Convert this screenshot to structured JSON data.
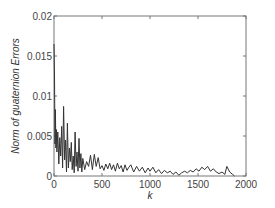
{
  "chart_data": {
    "type": "line",
    "title": "",
    "xlabel": "k",
    "ylabel": "Norm of guaternion Errors",
    "xlim": [
      0,
      2000
    ],
    "ylim": [
      0,
      0.02
    ],
    "xticks": [
      0,
      500,
      1000,
      1500,
      2000
    ],
    "xtick_labels": [
      "0",
      "500",
      "1000",
      "1500",
      "2000"
    ],
    "yticks": [
      0,
      0.005,
      0.01,
      0.015,
      0.02
    ],
    "ytick_labels": [
      "0",
      "0.005",
      "0.01",
      "0.015",
      "0.02"
    ],
    "grid": false,
    "legend": null,
    "line_color": "#333333",
    "series": [
      {
        "name": "quaternion error norm",
        "x": [
          0,
          5,
          10,
          15,
          20,
          25,
          30,
          40,
          50,
          60,
          70,
          80,
          90,
          100,
          110,
          120,
          130,
          140,
          150,
          160,
          170,
          180,
          190,
          200,
          210,
          220,
          230,
          240,
          250,
          260,
          270,
          280,
          290,
          300,
          320,
          340,
          360,
          380,
          400,
          420,
          440,
          460,
          480,
          500,
          520,
          540,
          560,
          580,
          600,
          620,
          640,
          660,
          680,
          700,
          720,
          740,
          760,
          780,
          800,
          830,
          860,
          890,
          920,
          950,
          980,
          1000,
          1030,
          1060,
          1090,
          1120,
          1150,
          1180,
          1210,
          1240,
          1270,
          1300,
          1330,
          1360,
          1390,
          1420,
          1450,
          1480,
          1510,
          1540,
          1570,
          1600,
          1630,
          1660,
          1690,
          1720,
          1750,
          1780,
          1800,
          1830,
          1860,
          1880
        ],
        "values": [
          0.0165,
          0.0125,
          0.004,
          0.0083,
          0.0035,
          0.0058,
          0.003,
          0.0055,
          0.0015,
          0.0048,
          0.0025,
          0.0062,
          0.001,
          0.0087,
          0.002,
          0.0045,
          0.0005,
          0.0066,
          0.001,
          0.0035,
          0.0018,
          0.0042,
          0.0008,
          0.0025,
          0.0004,
          0.0055,
          0.0012,
          0.003,
          0.0006,
          0.0047,
          0.001,
          0.0028,
          0.0005,
          0.0022,
          0.0008,
          0.0018,
          0.0012,
          0.0026,
          0.0008,
          0.0027,
          0.0012,
          0.0023,
          0.0009,
          0.0013,
          0.0007,
          0.0015,
          0.0009,
          0.0016,
          0.0008,
          0.0014,
          0.0006,
          0.0016,
          0.0009,
          0.0013,
          0.0005,
          0.0014,
          0.0007,
          0.0011,
          0.0014,
          0.0005,
          0.0012,
          0.0006,
          0.0011,
          0.0004,
          0.001,
          0.0006,
          0.0011,
          0.0004,
          0.0008,
          0.0003,
          0.0007,
          0.0004,
          0.0006,
          0.0002,
          0.0005,
          0.0001,
          0.0004,
          0.0006,
          0.0004,
          0.0007,
          0.0005,
          0.0009,
          0.0006,
          0.0011,
          0.0008,
          0.0012,
          0.0006,
          0.0009,
          0.0005,
          0.0003,
          0.0005,
          0.0002,
          0.0012,
          0.0005,
          0.0002,
          0.0
        ]
      }
    ]
  },
  "labels": {
    "xlabel": "k",
    "ylabel": "Norm of guaternion Errors"
  }
}
